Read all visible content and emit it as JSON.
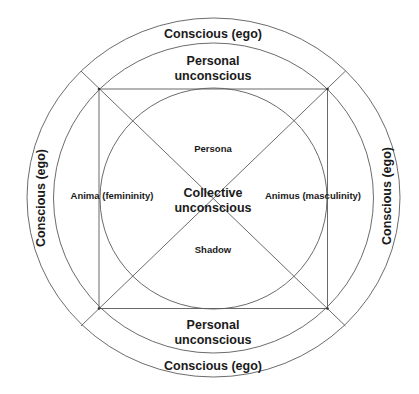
{
  "diagram": {
    "type": "concentric-model",
    "rings": {
      "outer": {
        "label": "Conscious (ego)"
      },
      "middle": {
        "label": "Personal unconscious"
      },
      "inner": {
        "label": "Collective unconscious"
      }
    },
    "labels": {
      "conscious_top": "Conscious (ego)",
      "conscious_bottom": "Conscious (ego)",
      "conscious_left": "Conscious (ego)",
      "conscious_right": "Conscious (ego)",
      "personal_top_line1": "Personal",
      "personal_top_line2": "unconscious",
      "personal_bottom_line1": "Personal",
      "personal_bottom_line2": "unconscious",
      "collective_line1": "Collective",
      "collective_line2": "unconscious",
      "persona": "Persona",
      "shadow": "Shadow",
      "anima": "Anima (femininity)",
      "animus": "Animus (masculinity)"
    },
    "colors": {
      "lines": "#5a5a5a",
      "text": "#1a1a1a",
      "background": "#ffffff"
    }
  }
}
